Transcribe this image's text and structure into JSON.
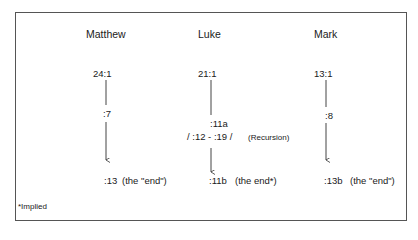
{
  "diagram": {
    "columns": [
      {
        "heading": "Matthew",
        "start": "24:1",
        "middle": ":7",
        "end": ":13",
        "end_note": "(the \"end\")"
      },
      {
        "heading": "Luke",
        "start": "21:1",
        "middle": ":11a",
        "recursion_range": "/ :12 - :19 /",
        "recursion_label": "(Recursion)",
        "end": ":11b",
        "end_note": "(the end*)"
      },
      {
        "heading": "Mark",
        "start": "13:1",
        "middle": ":8",
        "end": ":13b",
        "end_note": "(the \"end\")"
      }
    ],
    "footnote": "*Implied"
  }
}
